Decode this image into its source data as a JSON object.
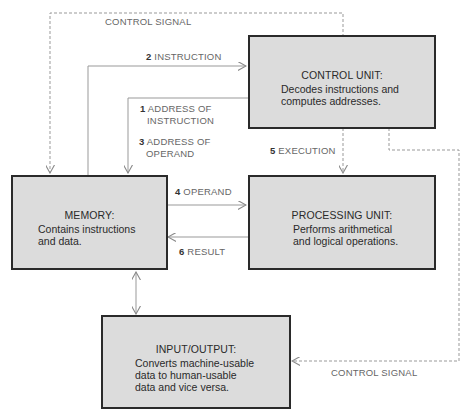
{
  "diagram": {
    "nodes": {
      "control_unit": {
        "title": "CONTROL UNIT:",
        "desc": [
          "Decodes instructions and",
          "computes addresses."
        ]
      },
      "memory": {
        "title": "MEMORY:",
        "desc": [
          "Contains instructions",
          "and data."
        ]
      },
      "processing_unit": {
        "title": "PROCESSING UNIT:",
        "desc": [
          "Performs arithmetical",
          "and logical operations."
        ]
      },
      "io": {
        "title": "INPUT/OUTPUT:",
        "desc": [
          "Converts machine-usable",
          "data to human-usable",
          "data and vice versa."
        ]
      }
    },
    "edges": {
      "control_signal_top": {
        "text": "CONTROL SIGNAL",
        "from": "control_unit",
        "to": "memory",
        "style": "dashed"
      },
      "instruction": {
        "num": "2",
        "text": "INSTRUCTION",
        "from": "memory",
        "to": "control_unit",
        "style": "solid"
      },
      "address_of_instruction": {
        "num": "1",
        "text": [
          "ADDRESS OF",
          "INSTRUCTION"
        ],
        "from": "control_unit",
        "to": "memory",
        "style": "solid"
      },
      "address_of_operand": {
        "num": "3",
        "text": [
          "ADDRESS OF",
          "OPERAND"
        ],
        "from": "control_unit",
        "to": "memory",
        "style": "solid"
      },
      "execution": {
        "num": "5",
        "text": "EXECUTION",
        "from": "control_unit",
        "to": "processing_unit",
        "style": "dashed"
      },
      "operand": {
        "num": "4",
        "text": "OPERAND",
        "from": "memory",
        "to": "processing_unit",
        "style": "solid"
      },
      "result": {
        "num": "6",
        "text": "RESULT",
        "from": "processing_unit",
        "to": "memory",
        "style": "solid"
      },
      "memory_io": {
        "text": "",
        "from": "memory",
        "to": "io",
        "style": "solid-bidirectional"
      },
      "control_signal_bottom": {
        "text": "CONTROL SIGNAL",
        "from": "control_unit",
        "to": "io",
        "style": "dashed"
      }
    }
  }
}
